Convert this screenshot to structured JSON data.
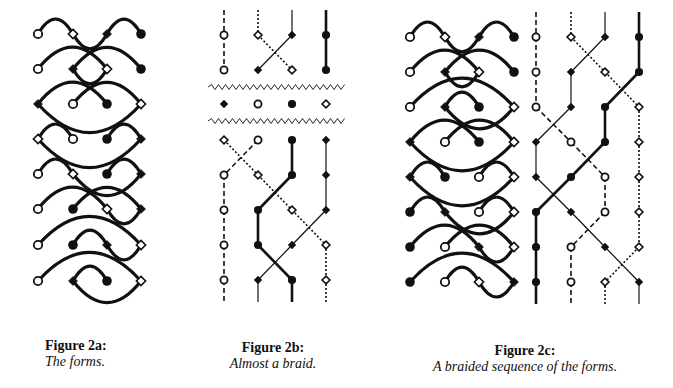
{
  "captions": {
    "a": {
      "title": "Figure 2a:",
      "subtitle": "The forms."
    },
    "b": {
      "title": "Figure 2b:",
      "subtitle": "Almost a braid."
    },
    "c": {
      "title": "Figure 2c:",
      "subtitle": "A braided sequence of the forms."
    }
  },
  "colors": {
    "ink": "#111111",
    "background": "#ffffff"
  },
  "node_types": [
    "open-circle",
    "open-diamond",
    "filled-diamond",
    "filled-circle"
  ],
  "figure_2a": {
    "columns_x": [
      38,
      73,
      107,
      141
    ],
    "rows": [
      {
        "y": 34,
        "nodes": [
          "oc",
          "od",
          "fd",
          "fc"
        ],
        "arcs": [
          [
            0,
            1,
            "up"
          ],
          [
            1,
            2,
            "down"
          ],
          [
            2,
            3,
            "up"
          ]
        ]
      },
      {
        "y": 69,
        "nodes": [
          "oc",
          "fd",
          "od",
          "fc"
        ],
        "arcs": [
          [
            0,
            2,
            "up"
          ],
          [
            1,
            3,
            "up"
          ],
          [
            1,
            2,
            "down"
          ]
        ]
      },
      {
        "y": 104,
        "nodes": [
          "fd",
          "oc",
          "fc",
          "od"
        ],
        "arcs": [
          [
            0,
            2,
            "up"
          ],
          [
            1,
            3,
            "up"
          ],
          [
            0,
            3,
            "down"
          ]
        ]
      },
      {
        "y": 139,
        "nodes": [
          "od",
          "oc",
          "fc",
          "fd"
        ],
        "arcs": [
          [
            0,
            1,
            "up"
          ],
          [
            2,
            3,
            "up"
          ],
          [
            0,
            3,
            "down"
          ]
        ]
      },
      {
        "y": 174,
        "nodes": [
          "oc",
          "od",
          "fc",
          "fd"
        ],
        "arcs": [
          [
            0,
            1,
            "up"
          ],
          [
            2,
            3,
            "up"
          ],
          [
            1,
            3,
            "down"
          ]
        ]
      },
      {
        "y": 209,
        "nodes": [
          "oc",
          "fc",
          "od",
          "fd"
        ],
        "arcs": [
          [
            0,
            2,
            "up"
          ],
          [
            1,
            3,
            "up"
          ],
          [
            2,
            3,
            "down"
          ]
        ]
      },
      {
        "y": 245,
        "nodes": [
          "oc",
          "fc",
          "fd",
          "od"
        ],
        "arcs": [
          [
            0,
            3,
            "up"
          ],
          [
            1,
            2,
            "up"
          ],
          [
            2,
            3,
            "down"
          ]
        ]
      },
      {
        "y": 281,
        "nodes": [
          "oc",
          "fd",
          "fc",
          "od"
        ],
        "arcs": [
          [
            0,
            3,
            "up"
          ],
          [
            1,
            2,
            "up"
          ],
          [
            1,
            3,
            "down"
          ]
        ]
      }
    ]
  },
  "figure_2b": {
    "columns_x": [
      224,
      258,
      292,
      326
    ],
    "top": {
      "rows_y": [
        35,
        70
      ],
      "nodes": [
        [
          "oc",
          "od",
          "fd",
          "fc"
        ],
        [
          "oc",
          "fd",
          "od",
          "fc"
        ]
      ],
      "strands": [
        {
          "from": [
            0,
            0
          ],
          "to": [
            0,
            1
          ],
          "style": "dashed"
        },
        {
          "from": [
            1,
            0
          ],
          "to": [
            2,
            1
          ],
          "style": "dotted"
        },
        {
          "from": [
            2,
            0
          ],
          "to": [
            1,
            1
          ],
          "style": "thin"
        },
        {
          "from": [
            3,
            0
          ],
          "to": [
            3,
            1
          ],
          "style": "thick"
        }
      ]
    },
    "zigzag_y": [
      87,
      121
    ],
    "middle": {
      "y": 104,
      "nodes": [
        "fd",
        "oc",
        "fc",
        "od"
      ]
    },
    "bottom": {
      "rows_y": [
        140,
        175,
        210,
        245,
        280
      ],
      "nodes": [
        [
          "od",
          "oc",
          "fc",
          "fd"
        ],
        [
          "oc",
          "od",
          "fc",
          "fd"
        ],
        [
          "oc",
          "fc",
          "od",
          "fd"
        ],
        [
          "oc",
          "fc",
          "fd",
          "od"
        ],
        [
          "oc",
          "fd",
          "fc",
          "od"
        ]
      ]
    }
  },
  "figure_2c": {
    "forms_columns_x": [
      410,
      445,
      479,
      514
    ],
    "braid_columns_x": [
      536,
      571,
      605,
      639
    ],
    "rows": [
      {
        "y": 37,
        "nodes": [
          "oc",
          "od",
          "fd",
          "fc"
        ],
        "arcs": [
          [
            0,
            1,
            "up"
          ],
          [
            1,
            2,
            "down"
          ],
          [
            2,
            3,
            "up"
          ]
        ]
      },
      {
        "y": 72,
        "nodes": [
          "oc",
          "fd",
          "od",
          "fc"
        ],
        "arcs": [
          [
            0,
            2,
            "up"
          ],
          [
            1,
            3,
            "up"
          ],
          [
            1,
            2,
            "down"
          ]
        ]
      },
      {
        "y": 107,
        "nodes": [
          "oc",
          "fd",
          "fc",
          "od"
        ],
        "arcs": [
          [
            0,
            3,
            "up"
          ],
          [
            1,
            2,
            "up"
          ],
          [
            1,
            3,
            "down"
          ]
        ]
      },
      {
        "y": 142,
        "nodes": [
          "fd",
          "oc",
          "fc",
          "od"
        ],
        "arcs": [
          [
            0,
            2,
            "up"
          ],
          [
            1,
            3,
            "up"
          ],
          [
            0,
            3,
            "down"
          ]
        ]
      },
      {
        "y": 177,
        "nodes": [
          "fd",
          "fc",
          "oc",
          "od"
        ],
        "arcs": [
          [
            0,
            1,
            "up"
          ],
          [
            2,
            3,
            "up"
          ],
          [
            0,
            3,
            "down"
          ]
        ]
      },
      {
        "y": 212,
        "nodes": [
          "fc",
          "fd",
          "oc",
          "od"
        ],
        "arcs": [
          [
            0,
            1,
            "up"
          ],
          [
            2,
            3,
            "up"
          ],
          [
            1,
            3,
            "down"
          ]
        ]
      },
      {
        "y": 247,
        "nodes": [
          "fc",
          "oc",
          "fd",
          "od"
        ],
        "arcs": [
          [
            0,
            2,
            "up"
          ],
          [
            1,
            3,
            "up"
          ],
          [
            2,
            3,
            "down"
          ]
        ]
      },
      {
        "y": 282,
        "nodes": [
          "fc",
          "oc",
          "od",
          "fd"
        ],
        "arcs": [
          [
            0,
            3,
            "up"
          ],
          [
            1,
            2,
            "up"
          ],
          [
            2,
            3,
            "down"
          ]
        ]
      }
    ],
    "braid_nodes": [
      [
        "oc",
        "od",
        "fd",
        "fc"
      ],
      [
        "oc",
        "fd",
        "od",
        "fc"
      ],
      [
        "oc",
        "fd",
        "fc",
        "od"
      ],
      [
        "fd",
        "oc",
        "fc",
        "od"
      ],
      [
        "fd",
        "fc",
        "oc",
        "od"
      ],
      [
        "fc",
        "fd",
        "oc",
        "od"
      ],
      [
        "fc",
        "oc",
        "fd",
        "od"
      ],
      [
        "fc",
        "oc",
        "od",
        "fd"
      ]
    ]
  }
}
